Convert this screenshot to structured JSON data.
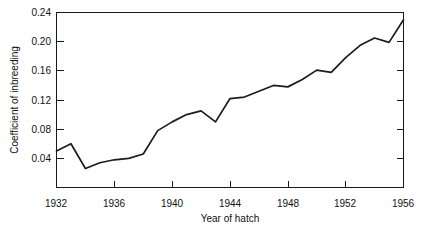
{
  "chart_data": {
    "type": "line",
    "title": "",
    "xlabel": "Year of hatch",
    "ylabel": "Coefficient of inbreeding",
    "xlim": [
      1932,
      1956
    ],
    "ylim": [
      0.0,
      0.24
    ],
    "grid": false,
    "legend": null,
    "x_ticks": [
      "1932",
      "1936",
      "1940",
      "1944",
      "1948",
      "1952",
      "1956"
    ],
    "x_tick_values": [
      1932,
      1936,
      1940,
      1944,
      1948,
      1952,
      1956
    ],
    "y_ticks": [
      "0.04",
      "0.08",
      "0.12",
      "0.16",
      "0.20",
      "0.24"
    ],
    "y_tick_values": [
      0.04,
      0.08,
      0.12,
      0.16,
      0.2,
      0.24
    ],
    "line_color": "#1c1c1c",
    "x": [
      1932,
      1933,
      1934,
      1935,
      1936,
      1937,
      1938,
      1939,
      1940,
      1941,
      1942,
      1943,
      1944,
      1945,
      1946,
      1947,
      1948,
      1949,
      1950,
      1951,
      1952,
      1953,
      1954,
      1955,
      1956
    ],
    "values": [
      0.05,
      0.06,
      0.026,
      0.034,
      0.038,
      0.04,
      0.046,
      0.078,
      0.09,
      0.1,
      0.105,
      0.09,
      0.122,
      0.124,
      0.132,
      0.14,
      0.138,
      0.148,
      0.161,
      0.158,
      0.178,
      0.195,
      0.205,
      0.199,
      0.23
    ],
    "series": [
      {
        "name": "Coefficient of inbreeding",
        "values": [
          0.05,
          0.06,
          0.026,
          0.034,
          0.038,
          0.04,
          0.046,
          0.078,
          0.09,
          0.1,
          0.105,
          0.09,
          0.122,
          0.124,
          0.132,
          0.14,
          0.138,
          0.148,
          0.161,
          0.158,
          0.178,
          0.195,
          0.205,
          0.199,
          0.23
        ]
      }
    ]
  },
  "axis": {
    "x_title": "Year of hatch",
    "y_title": "Coefficient of inbreeding"
  },
  "y_tick_labels": {
    "t0": "0.24",
    "t1": "0.20",
    "t2": "0.16",
    "t3": "0.12",
    "t4": "0.08",
    "t5": "0.04"
  },
  "x_tick_labels": {
    "t0": "1932",
    "t1": "1936",
    "t2": "1940",
    "t3": "1944",
    "t4": "1948",
    "t5": "1952",
    "t6": "1956"
  }
}
